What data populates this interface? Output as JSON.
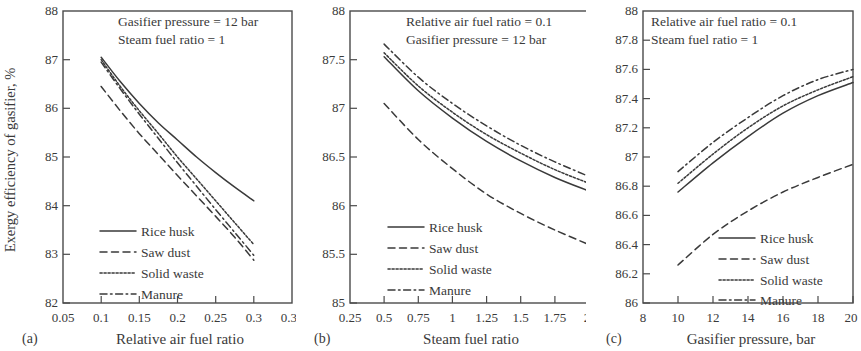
{
  "figure": {
    "shared_ylabel": "Exergy efficiency of gasifier, %",
    "series_names": [
      "Rice husk",
      "Saw dust",
      "Solid waste",
      "Manure"
    ],
    "line_styles": [
      "solid",
      "dashed",
      "dotted",
      "dashdot"
    ],
    "line_color": "#3a3a3a",
    "panels": [
      {
        "letter": "(a)"
      },
      {
        "letter": "(b)"
      },
      {
        "letter": "(c)"
      }
    ]
  },
  "chart_data": [
    {
      "type": "line",
      "panel": "(a)",
      "title": "",
      "xlabel": "Relative air fuel ratio",
      "ylabel": "Exergy efficiency of gasifier, %",
      "xlim": [
        0.05,
        0.35
      ],
      "ylim": [
        82,
        88
      ],
      "xticks": [
        0.05,
        0.1,
        0.15,
        0.2,
        0.25,
        0.3,
        0.35
      ],
      "xtick_labels": [
        "0.05",
        "0.1",
        "0.15",
        "0.2",
        "0.25",
        "0.3",
        "0.35"
      ],
      "yticks": [
        82,
        83,
        84,
        85,
        86,
        87,
        88
      ],
      "ytick_labels": [
        "82",
        "83",
        "84",
        "85",
        "86",
        "87",
        "88"
      ],
      "grid": false,
      "legend_position": "lower-left-inside",
      "annotations": [
        "Gasifier pressure = 12 bar",
        "Steam fuel ratio = 1"
      ],
      "x": [
        0.1,
        0.125,
        0.15,
        0.175,
        0.2,
        0.225,
        0.25,
        0.275,
        0.3
      ],
      "series": [
        {
          "name": "Rice husk",
          "style": "solid",
          "values": [
            87.05,
            86.55,
            86.1,
            85.7,
            85.35,
            85.0,
            84.68,
            84.38,
            84.1
          ]
        },
        {
          "name": "Saw dust",
          "style": "dashed",
          "values": [
            86.45,
            85.95,
            85.48,
            85.05,
            84.62,
            84.2,
            83.78,
            83.35,
            82.88
          ]
        },
        {
          "name": "Solid waste",
          "style": "dotted",
          "values": [
            87.0,
            86.45,
            85.95,
            85.48,
            85.0,
            84.55,
            84.1,
            83.65,
            83.2
          ]
        },
        {
          "name": "Manure",
          "style": "dashdot",
          "values": [
            86.95,
            86.4,
            85.88,
            85.38,
            84.88,
            84.4,
            83.92,
            83.45,
            82.98
          ]
        }
      ]
    },
    {
      "type": "line",
      "panel": "(b)",
      "title": "",
      "xlabel": "Steam fuel ratio",
      "ylabel": "Exergy efficiency of gasifier, %",
      "xlim": [
        0.25,
        2.0
      ],
      "ylim": [
        85,
        88
      ],
      "xticks": [
        0.25,
        0.5,
        0.75,
        1,
        1.25,
        1.5,
        1.75,
        2
      ],
      "xtick_labels": [
        "0.25",
        "0.5",
        "0.75",
        "1",
        "1.25",
        "1.5",
        "1.75",
        "2"
      ],
      "yticks": [
        85,
        85.5,
        86,
        86.5,
        87,
        87.5,
        88
      ],
      "ytick_labels": [
        "85",
        "85.5",
        "86",
        "86.5",
        "87",
        "87.5",
        "88"
      ],
      "grid": false,
      "legend_position": "lower-left-inside",
      "annotations": [
        "Relative air fuel ratio = 0.1",
        "Gasifier pressure = 12 bar"
      ],
      "x": [
        0.5,
        0.75,
        1.0,
        1.25,
        1.5,
        1.75,
        2.0
      ],
      "series": [
        {
          "name": "Rice husk",
          "style": "solid",
          "values": [
            87.53,
            87.18,
            86.9,
            86.66,
            86.46,
            86.29,
            86.15
          ]
        },
        {
          "name": "Saw dust",
          "style": "dashed",
          "values": [
            87.05,
            86.68,
            86.38,
            86.12,
            85.92,
            85.75,
            85.6
          ]
        },
        {
          "name": "Solid waste",
          "style": "dotted",
          "values": [
            87.57,
            87.23,
            86.96,
            86.73,
            86.54,
            86.37,
            86.23
          ]
        },
        {
          "name": "Manure",
          "style": "dashdot",
          "values": [
            87.66,
            87.32,
            87.05,
            86.82,
            86.62,
            86.45,
            86.3
          ]
        }
      ]
    },
    {
      "type": "line",
      "panel": "(c)",
      "title": "",
      "xlabel": "Gasifier pressure, bar",
      "ylabel": "Exergy efficiency of gasifier, %",
      "xlim": [
        8,
        20
      ],
      "ylim": [
        86,
        88
      ],
      "xticks": [
        8,
        10,
        12,
        14,
        16,
        18,
        20
      ],
      "xtick_labels": [
        "8",
        "10",
        "12",
        "14",
        "16",
        "18",
        "20"
      ],
      "yticks": [
        86,
        86.2,
        86.4,
        86.6,
        86.8,
        87,
        87.2,
        87.4,
        87.6,
        87.8,
        88
      ],
      "ytick_labels": [
        "86",
        "86.2",
        "86.4",
        "86.6",
        "86.8",
        "87",
        "87.2",
        "87.4",
        "87.6",
        "87.8",
        "88"
      ],
      "grid": false,
      "legend_position": "lower-right-inside",
      "annotations": [
        "Relative air fuel ratio = 0.1",
        "Steam fuel ratio = 1"
      ],
      "x": [
        10,
        12,
        14,
        16,
        18,
        20
      ],
      "series": [
        {
          "name": "Rice husk",
          "style": "solid",
          "values": [
            86.76,
            86.96,
            87.14,
            87.3,
            87.42,
            87.51
          ]
        },
        {
          "name": "Saw dust",
          "style": "dashed",
          "values": [
            86.26,
            86.47,
            86.63,
            86.76,
            86.86,
            86.95
          ]
        },
        {
          "name": "Solid waste",
          "style": "dotted",
          "values": [
            86.82,
            87.02,
            87.2,
            87.35,
            87.46,
            87.55
          ]
        },
        {
          "name": "Manure",
          "style": "dashdot",
          "values": [
            86.9,
            87.1,
            87.27,
            87.42,
            87.53,
            87.6
          ]
        }
      ]
    }
  ]
}
